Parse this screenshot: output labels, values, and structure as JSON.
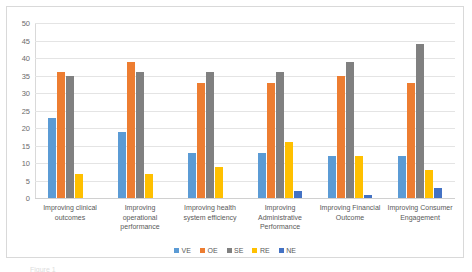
{
  "chart_data": {
    "type": "bar",
    "title": "",
    "subtitle": "",
    "xlabel": "",
    "ylabel": "",
    "ylim": [
      0,
      50
    ],
    "ytick_step": 5,
    "yticks": [
      "0",
      "5",
      "10",
      "15",
      "20",
      "25",
      "30",
      "35",
      "40",
      "45",
      "50"
    ],
    "grid": true,
    "grid_axis": "y",
    "legend_position": "bottom",
    "categories": [
      "Improving clinical outcomes",
      "Improving operational performance",
      "Improving health system efficiency",
      "Improving Administrative Performance",
      "Improving Financial Outcome",
      "Improving Consumer Engagement"
    ],
    "series": [
      {
        "name": "VE",
        "color": "#5B9BD5",
        "values": [
          23,
          19,
          13,
          13,
          12,
          12
        ]
      },
      {
        "name": "OE",
        "color": "#ED7D31",
        "values": [
          36,
          39,
          33,
          33,
          35,
          33
        ]
      },
      {
        "name": "SE",
        "color": "#808080",
        "values": [
          35,
          36,
          36,
          36,
          39,
          44
        ]
      },
      {
        "name": "RE",
        "color": "#FFC000",
        "values": [
          7,
          7,
          9,
          16,
          12,
          8
        ]
      },
      {
        "name": "NE",
        "color": "#4472C4",
        "values": [
          0,
          0,
          0,
          2,
          1,
          3
        ]
      }
    ]
  },
  "caption": {
    "partial_text": "Figure 1"
  }
}
